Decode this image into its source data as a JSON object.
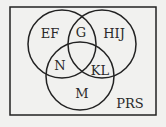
{
  "diagram": {
    "type": "venn",
    "universe_label": "PRS",
    "regions": {
      "top_left_only": "EF",
      "top_left_right_overlap": "G",
      "top_right_only": "HIJ",
      "left_bottom_overlap": "N",
      "right_bottom_overlap": "KL",
      "bottom_only": "M"
    },
    "colors": {
      "background": "#f1f1ef",
      "stroke": "#222222",
      "text": "#2a2a2a"
    }
  }
}
